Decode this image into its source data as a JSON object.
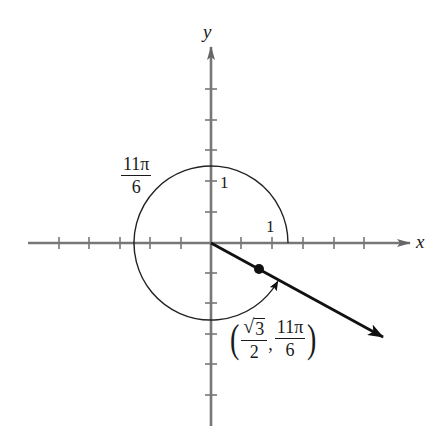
{
  "diagram": {
    "type": "unit-circle-polar-angle",
    "axes": {
      "x_label": "x",
      "y_label": "y",
      "origin_px": [
        211,
        243
      ],
      "tick_spacing_px": 30.5,
      "x_ticks_left": 5,
      "x_ticks_right": 5,
      "y_ticks_up": 5,
      "y_ticks_down": 6
    },
    "circle": {
      "radius_label": "1",
      "x_intercept_label": "1",
      "radius_px": 77
    },
    "angle_label": {
      "numerator": "11π",
      "denominator": "6"
    },
    "point": {
      "label_r_numerator": "3",
      "label_r_radical": "√",
      "label_r_denominator": "2",
      "separator": ",",
      "label_theta_numerator": "11π",
      "label_theta_denominator": "6",
      "open_paren": "(",
      "close_paren": ")"
    },
    "colors": {
      "axis": "#555555",
      "ink": "#111111",
      "background": "#ffffff"
    }
  }
}
